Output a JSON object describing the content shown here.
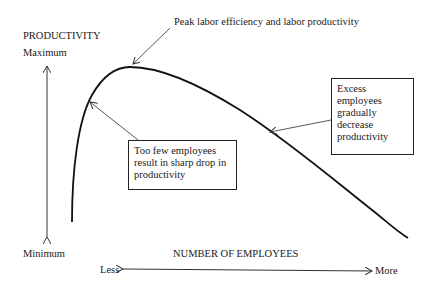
{
  "diagram": {
    "y_axis": {
      "title": "PRODUCTIVITY",
      "max_label": "Maximum",
      "min_label": "Minimum"
    },
    "x_axis": {
      "title": "NUMBER OF EMPLOYEES",
      "left_label": "Less",
      "right_label": "More"
    },
    "annotations": {
      "peak": "Peak labor efficiency and labor productivity",
      "too_few": [
        "Too few employees",
        "result in sharp drop in",
        "productivity"
      ],
      "excess": [
        "Excess",
        "employees",
        "gradually",
        "decrease",
        "productivity"
      ]
    },
    "colors": {
      "curve": "#111111",
      "arrows": "#444444",
      "text": "#1a1a1a"
    }
  }
}
